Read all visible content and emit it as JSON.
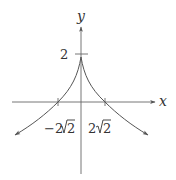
{
  "diagram": {
    "type": "function-graph",
    "colors": {
      "stroke": "#555555",
      "text": "#333333",
      "background": "#ffffff"
    },
    "axes": {
      "x_label": "x",
      "y_label": "y"
    },
    "labels": {
      "y_intercept": "2",
      "neg_root_coef": "−2",
      "neg_root_rad": "2",
      "pos_root_coef": "2",
      "pos_root_rad": "2"
    },
    "key_points": [
      {
        "name": "y-intercept",
        "x": 0,
        "y": 2
      },
      {
        "name": "x-intercept-left",
        "x": "-2√2",
        "y": 0
      },
      {
        "name": "x-intercept-right",
        "x": "2√2",
        "y": 0
      }
    ],
    "shape": "symmetric cusp at (0,2) decreasing toward both sides, crossing x-axis at ±2√2, continuing downward with arrows"
  }
}
